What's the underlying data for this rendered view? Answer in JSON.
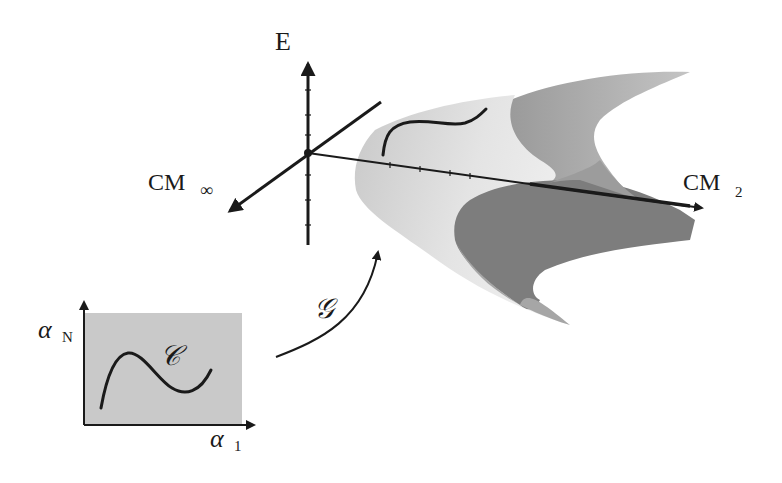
{
  "figure": {
    "type": "mapping diagram",
    "labels": {
      "energy_axis": "E",
      "cm_inf_main": "CM",
      "cm_inf_sub": "∞",
      "cm2_main": "CM",
      "cm2_sub": "2",
      "alpha_n_main": "α",
      "alpha_n_sub": "N",
      "alpha_1_main": "α",
      "alpha_1_sub": "1",
      "curve_label": "𝒞",
      "map_label": "𝒢"
    },
    "colors": {
      "surface_light": "#d4d4d4",
      "surface_lighter": "#e6e6e6",
      "surface_dark": "#7d7d7d",
      "surface_mid": "#a8a8a8",
      "param_box": "#c9c9c9",
      "ink": "#1a1a1a"
    }
  }
}
